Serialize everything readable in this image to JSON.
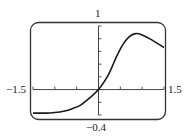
{
  "chart_data": {
    "type": "line",
    "title": "",
    "xlabel": "",
    "ylabel": "",
    "xlim": [
      -1.5,
      1.5
    ],
    "ylim": [
      -0.4,
      1
    ],
    "x_tick_step": 0.5,
    "y_tick_step": 0.2,
    "grid": false,
    "window_labels": {
      "xmin": "−1.5",
      "xmax": "1.5",
      "ymin": "−0.4",
      "ymax": "1"
    },
    "series": [
      {
        "name": "f(x)",
        "x": [
          -1.5,
          -1.2,
          -1.0,
          -0.8,
          -0.6,
          -0.4,
          -0.2,
          0.0,
          0.2,
          0.3,
          0.4,
          0.55,
          0.7,
          0.85,
          1.0,
          1.2,
          1.5
        ],
        "y": [
          -0.37,
          -0.37,
          -0.36,
          -0.34,
          -0.3,
          -0.24,
          -0.13,
          0.0,
          0.2,
          0.34,
          0.5,
          0.7,
          0.83,
          0.88,
          0.86,
          0.79,
          0.66
        ]
      }
    ]
  },
  "colors": {
    "curve": "#1a1a1a",
    "frame": "#333333",
    "axes": "#444444"
  }
}
